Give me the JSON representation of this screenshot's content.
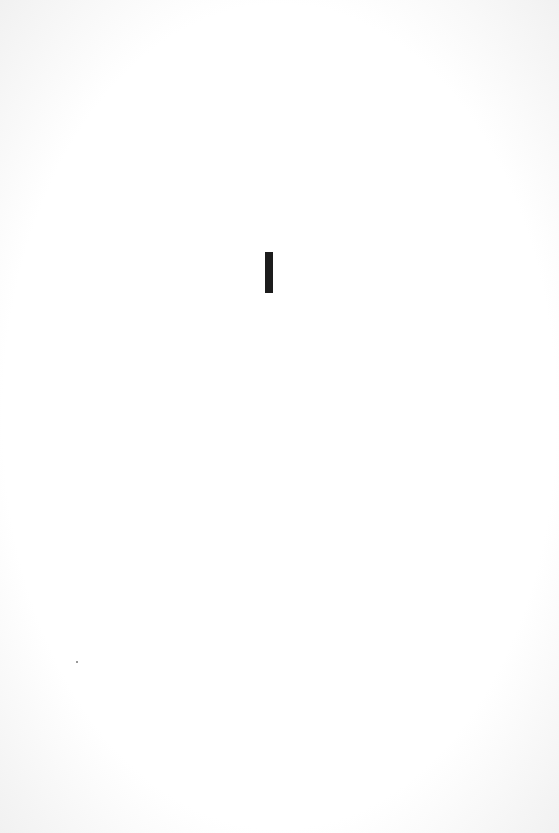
{
  "page": {
    "type": "scanned-blank-page",
    "marks": [
      {
        "name": "vertical-bar",
        "color": "#1c1c1c"
      },
      {
        "name": "speck",
        "color": "#777777"
      }
    ]
  }
}
